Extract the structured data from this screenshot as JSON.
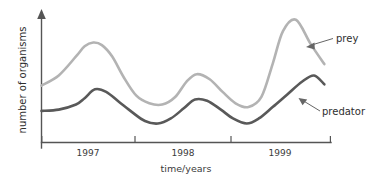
{
  "chart_data": {
    "type": "line",
    "title": "",
    "subtitle": "",
    "xlabel": "time/years",
    "ylabel": "number of organisms",
    "grid": false,
    "legend_position": "inline-annotations",
    "xlim": [
      1996.5,
      1999.85
    ],
    "ylim": [
      0,
      100
    ],
    "xtick_labels": [
      "1997",
      "1998",
      "1999"
    ],
    "xtick_values": [
      1997,
      1998,
      1999
    ],
    "ytick_labels": [],
    "axis_style": "y-axis-arrow-open-ended",
    "annotations": [
      {
        "text": "prey",
        "points_to_series": "prey",
        "x": 1999.15,
        "y": 72
      },
      {
        "text": "predator",
        "points_to_series": "predator",
        "x": 1999.2,
        "y": 40
      }
    ],
    "series": [
      {
        "name": "prey",
        "color": "#b3b3b3",
        "x": [
          1996.5,
          1996.7,
          1996.9,
          1997.0,
          1997.1,
          1997.2,
          1997.32,
          1997.45,
          1997.6,
          1997.75,
          1997.9,
          1998.05,
          1998.18,
          1998.3,
          1998.45,
          1998.6,
          1998.75,
          1998.9,
          1999.05,
          1999.18,
          1999.3,
          1999.45,
          1999.62,
          1999.78
        ],
        "y": [
          45,
          53,
          68,
          76,
          79,
          77,
          68,
          52,
          37,
          31,
          30,
          36,
          48,
          54,
          50,
          40,
          31,
          28,
          36,
          62,
          88,
          97,
          78,
          62
        ]
      },
      {
        "name": "predator",
        "color": "#595959",
        "x": [
          1996.5,
          1996.7,
          1996.9,
          1997.0,
          1997.12,
          1997.25,
          1997.4,
          1997.55,
          1997.7,
          1997.85,
          1998.0,
          1998.15,
          1998.28,
          1998.42,
          1998.58,
          1998.72,
          1998.88,
          1999.02,
          1999.18,
          1999.35,
          1999.52,
          1999.66,
          1999.78
        ],
        "y": [
          25,
          26,
          30,
          35,
          42,
          40,
          32,
          24,
          17,
          15,
          19,
          27,
          34,
          33,
          26,
          19,
          15,
          19,
          28,
          38,
          48,
          53,
          46
        ]
      }
    ]
  },
  "axes": {
    "y_axis_label": "number of organisms",
    "x_axis_label": "time/years",
    "ticks": [
      {
        "label": "1997"
      },
      {
        "label": "1998"
      },
      {
        "label": "1999"
      }
    ]
  },
  "labels": {
    "prey": "prey",
    "predator": "predator"
  },
  "colors": {
    "prey_line": "#b3b3b3",
    "predator_line": "#595959",
    "axis": "#555555",
    "text": "#2e2e2e",
    "background": "#ffffff"
  }
}
